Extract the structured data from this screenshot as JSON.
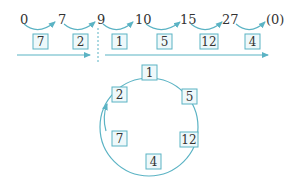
{
  "colors": {
    "accent": "#5bb3c4",
    "text": "#333333",
    "box_fill": "#eef8fa"
  },
  "top_row": {
    "numbers": [
      "0",
      "7",
      "9",
      "10",
      "15",
      "27",
      "(0)"
    ],
    "steps": [
      "7",
      "2",
      "1",
      "5",
      "12",
      "4"
    ]
  },
  "cycle": {
    "items": [
      "1",
      "5",
      "12",
      "4",
      "7",
      "2"
    ]
  }
}
